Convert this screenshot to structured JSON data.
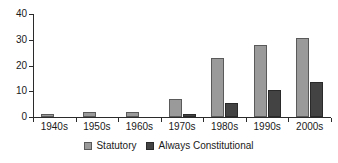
{
  "chart_data": {
    "type": "bar",
    "title": "",
    "xlabel": "",
    "ylabel": "",
    "categories": [
      "1940s",
      "1950s",
      "1960s",
      "1970s",
      "1980s",
      "1990s",
      "2000s"
    ],
    "series": [
      {
        "name": "Statutory",
        "color": "#9a9a9a",
        "values": [
          1,
          2,
          2,
          7,
          23,
          28,
          30.5
        ]
      },
      {
        "name": "Always Constitutional",
        "color": "#434343",
        "values": [
          0,
          0,
          0,
          1,
          5.5,
          10.5,
          13.5
        ]
      }
    ],
    "ylim": [
      0,
      40
    ],
    "yticks": [
      0,
      10,
      20,
      30,
      40
    ],
    "ytick_labels": [
      "0",
      "10",
      "20",
      "30",
      "40"
    ],
    "grid": false,
    "legend_position": "bottom"
  }
}
